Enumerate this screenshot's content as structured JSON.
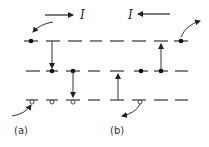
{
  "figure": {
    "panels": [
      {
        "id": "a",
        "label": "(a)",
        "current_label": "I",
        "current_direction": "right",
        "transitions": "downward",
        "description": "Carriers drop from top level to middle level to bottom level; electron enters top level from left, hole enters bottom level from left"
      },
      {
        "id": "b",
        "label": "(b)",
        "current_label": "I",
        "current_direction": "left",
        "transitions": "upward",
        "description": "Carriers rise from bottom level to middle level to top level; electron exits top level to right, hole exits bottom level"
      }
    ],
    "levels": [
      "top",
      "middle",
      "bottom"
    ],
    "colors": {
      "line": "#222222",
      "background": "#ffffff"
    }
  }
}
